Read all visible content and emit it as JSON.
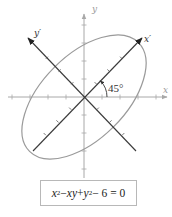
{
  "diagram": {
    "axes": {
      "x_label": "x",
      "y_label": "y",
      "x_prime_label": "x′",
      "y_prime_label": "y′"
    },
    "rotation_angle_label": "45°",
    "rotation_angle_deg": 45,
    "equation": {
      "parts": [
        {
          "type": "var",
          "text": "x"
        },
        {
          "type": "sup",
          "text": "2"
        },
        {
          "type": "op",
          "text": " − "
        },
        {
          "type": "var",
          "text": "xy"
        },
        {
          "type": "op",
          "text": " + "
        },
        {
          "type": "var",
          "text": "y"
        },
        {
          "type": "sup",
          "text": "2"
        },
        {
          "type": "op",
          "text": " − 6 = 0"
        }
      ],
      "full_text": "x² − xy + y² − 6 = 0"
    },
    "ellipse": {
      "semi_major_axis_along": "x′",
      "semi_major": 3.4641,
      "semi_minor": 2,
      "rotation_deg": 45
    },
    "colors": {
      "original_axes": "#a8a8a8",
      "rotated_axes": "#3a3a3a",
      "ellipse": "#9a9a9a"
    }
  }
}
